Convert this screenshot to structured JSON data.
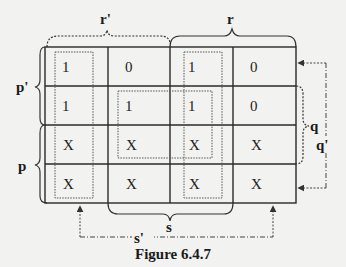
{
  "figure": {
    "caption": "Figure 6.4.7"
  },
  "kmap": {
    "column_labels": {
      "top_left_group": "r'",
      "top_right_group": "r",
      "bottom_middle_group": "s",
      "bottom_outer_group": "s'"
    },
    "row_labels": {
      "left_top_group": "p'",
      "left_bottom_group": "p",
      "right_middle_group": "q",
      "right_outer_group": "q'"
    },
    "rows": [
      [
        "1",
        "0",
        "1",
        "0"
      ],
      [
        "1",
        "1",
        "1",
        "0"
      ],
      [
        "X",
        "X",
        "X",
        "X"
      ],
      [
        "X",
        "X",
        "X",
        "X"
      ]
    ],
    "groupings": [
      {
        "name": "column-1-loop",
        "cells": "col 1, rows 1-4",
        "style": "dotted"
      },
      {
        "name": "column-3-loop",
        "cells": "col 3, rows 1-4",
        "style": "dotted"
      },
      {
        "name": "center-quad-loop",
        "cells": "cols 2-3, rows 2-3",
        "style": "dotted"
      }
    ]
  },
  "colors": {
    "line": "#2a2a2a",
    "background": "#f2f2f0"
  }
}
